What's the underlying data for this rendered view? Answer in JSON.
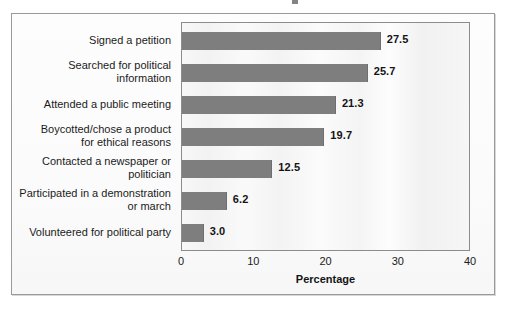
{
  "figure": {
    "frame_border_color": "#9a9a9a",
    "plot_border_color": "#8c8c8c",
    "bar_color": "#7e7e7e",
    "text_color": "#1b1b1b"
  },
  "chart_data": {
    "type": "bar",
    "orientation": "horizontal",
    "title": "",
    "xlabel": "Percentage",
    "ylabel": "",
    "xlim": [
      0,
      40
    ],
    "xticks": [
      "0",
      "10",
      "20",
      "30",
      "40"
    ],
    "grid": false,
    "legend": null,
    "categories": [
      "Signed a petition",
      "Searched for political\ninformation",
      "Attended a public meeting",
      "Boycotted/chose a product\nfor ethical reasons",
      "Contacted a newspaper or\npolitician",
      "Participated in a demonstration\nor march",
      "Volunteered for political party"
    ],
    "values": [
      27.5,
      25.7,
      21.3,
      19.7,
      12.5,
      6.2,
      3.0
    ],
    "value_labels": [
      "27.5",
      "25.7",
      "21.3",
      "19.7",
      "12.5",
      "6.2",
      "3.0"
    ]
  }
}
